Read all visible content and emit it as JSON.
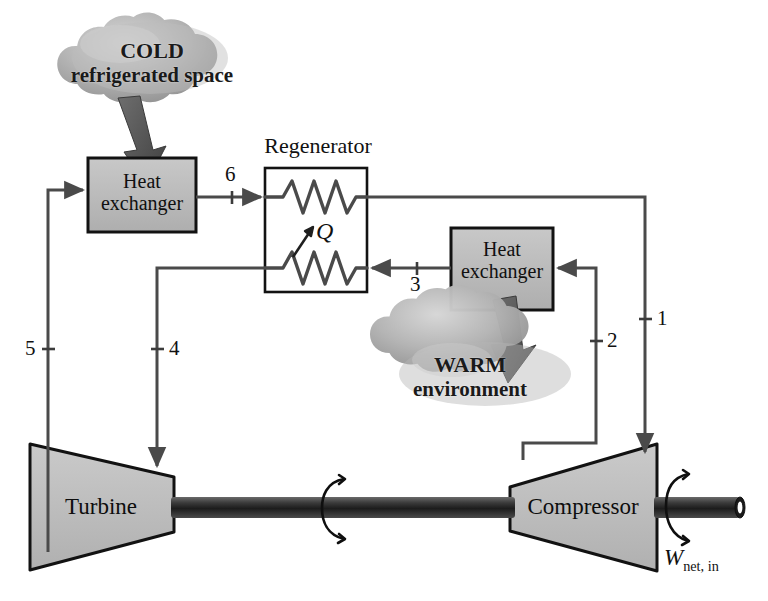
{
  "figure": {
    "type": "process-flow-diagram"
  },
  "reservoirs": {
    "cold": {
      "line1": "COLD",
      "line2": "refrigerated space",
      "name": "cold-refrigerated-space"
    },
    "warm": {
      "line1": "WARM",
      "line2": "environment",
      "name": "warm-environment"
    }
  },
  "components": {
    "heat_exchanger_cold": {
      "line1": "Heat",
      "line2": "exchanger"
    },
    "heat_exchanger_warm": {
      "line1": "Heat",
      "line2": "exchanger"
    },
    "regenerator": {
      "label": "Regenerator"
    },
    "turbine": {
      "label": "Turbine"
    },
    "compressor": {
      "label": "Compressor"
    }
  },
  "labels": {
    "heat_transfer": "Q",
    "work_symbol": "W",
    "work_subscript": "net, in"
  },
  "state_points": [
    {
      "id": "1",
      "label": "1"
    },
    {
      "id": "2",
      "label": "2"
    },
    {
      "id": "3",
      "label": "3"
    },
    {
      "id": "4",
      "label": "4"
    },
    {
      "id": "5",
      "label": "5"
    },
    {
      "id": "6",
      "label": "6"
    }
  ],
  "colors": {
    "line": "#4a4a4a",
    "outline": "#121212",
    "box_fill": "#b9b9b9",
    "machine_fill": "#bfbfbf",
    "cloud_fill": "#a9a9a9",
    "shaft_dark": "#2a2a2a",
    "arrow_heavy": "#555555",
    "background": "#ffffff"
  }
}
